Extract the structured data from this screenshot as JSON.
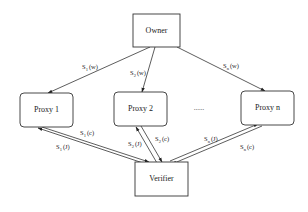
{
  "diagram": {
    "nodes": {
      "owner": {
        "label": "Owner"
      },
      "proxy1": {
        "label": "Proxy 1"
      },
      "proxy2": {
        "label": "Proxy 2"
      },
      "proxyn": {
        "label": "Proxy n"
      },
      "verifier": {
        "label": "Verifier"
      }
    },
    "ellipsis": "......",
    "edges": {
      "owner_proxy1": {
        "base": "S",
        "sub": "1",
        "arg": "(w)"
      },
      "owner_proxy2": {
        "base": "S",
        "sub": "2",
        "arg": "(w)"
      },
      "owner_proxyn": {
        "base": "S",
        "sub": "n",
        "arg": "(w)"
      },
      "proxy1_verifier": {
        "base": "S",
        "sub": "1",
        "arg": "(c)"
      },
      "verifier_proxy1": {
        "base": "S",
        "sub": "1",
        "arg": "(J)"
      },
      "verifier_proxy2": {
        "base": "S",
        "sub": "2",
        "arg": "(J)"
      },
      "proxy2_verifier": {
        "base": "S",
        "sub": "2",
        "arg": "(c)"
      },
      "verifier_proxyn": {
        "base": "S",
        "sub": "n",
        "arg": "(J)"
      },
      "proxyn_verifier": {
        "base": "S",
        "sub": "n",
        "arg": "(c)"
      }
    }
  }
}
